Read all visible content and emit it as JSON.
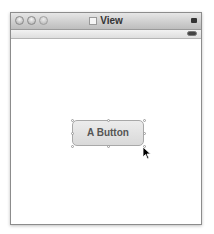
{
  "window": {
    "title": "View",
    "title_icon": "document-icon",
    "controls": [
      "close",
      "minimize",
      "zoom"
    ]
  },
  "content": {
    "button": {
      "label": "A Button",
      "selected": true
    }
  },
  "colors": {
    "titlebar_top": "#e6e6e6",
    "titlebar_bottom": "#bdbdbd",
    "button_fill": "#e0e0e0",
    "button_text": "#555555"
  }
}
